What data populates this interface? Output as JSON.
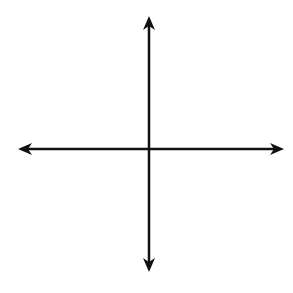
{
  "chart_data": {
    "type": "diagram",
    "title": "",
    "grid": {
      "cells_x": 10,
      "cells_y": 10,
      "xmin": -5,
      "xmax": 5,
      "ymin": -5,
      "ymax": 5,
      "grid_on": true
    },
    "axes": {
      "x_label": "x",
      "y_label": "y",
      "origin_label": "O"
    },
    "vertices": [
      {
        "name": "F",
        "x": -2,
        "y": 4
      },
      {
        "name": "G",
        "x": 4,
        "y": 2
      },
      {
        "name": "H",
        "x": 4,
        "y": -2
      },
      {
        "name": "J",
        "x": -2,
        "y": -1
      }
    ]
  },
  "labels": {
    "F": "F",
    "G": "G",
    "H": "H",
    "J": "J",
    "O": "O",
    "x": "x",
    "y": "y"
  },
  "colors": {
    "grid": "#8c8c8c",
    "axis": "#111111",
    "polygon": "#555555"
  }
}
